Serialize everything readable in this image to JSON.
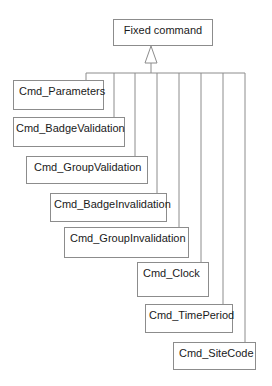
{
  "diagram": {
    "type": "uml-class-inheritance",
    "parent": {
      "label": "Fixed command"
    },
    "children": [
      {
        "label": "Cmd_Parameters"
      },
      {
        "label": "Cmd_BadgeValidation"
      },
      {
        "label": "Cmd_GroupValidation"
      },
      {
        "label": "Cmd_BadgeInvalidation"
      },
      {
        "label": "Cmd_GroupInvalidation"
      },
      {
        "label": "Cmd_Clock"
      },
      {
        "label": "Cmd_TimePeriod"
      },
      {
        "label": "Cmd_SiteCode"
      }
    ],
    "relationship": "generalization",
    "colors": {
      "line": "#8c8c8c",
      "text": "#1a1a1a",
      "background": "#ffffff"
    }
  }
}
